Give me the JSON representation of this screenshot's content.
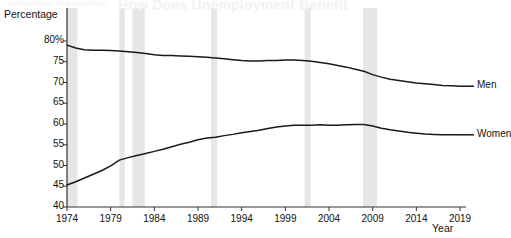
{
  "ghost_text": {
    "heading": "How Does Unemployment Benefit",
    "subheading": "percentage of population"
  },
  "axis": {
    "y_title": "Percentage",
    "x_title": "Year"
  },
  "series_labels": {
    "men": "Men",
    "women": "Women"
  },
  "colors": {
    "line": "#1a1a1a",
    "recession_band": "#e6e6e6",
    "axis": "#333333",
    "background": "#ffffff",
    "text": "#111111"
  },
  "chart_data": {
    "type": "line",
    "title": "",
    "subtitle": "",
    "xlabel": "Year",
    "ylabel": "Percentage",
    "xlim": [
      1974,
      2019
    ],
    "ylim": [
      40,
      80
    ],
    "grid": false,
    "legend_position": "right-inline",
    "y_ticks": [
      "40",
      "45",
      "50",
      "55",
      "60",
      "65",
      "70",
      "75",
      "80%"
    ],
    "y_tick_values": [
      40,
      45,
      50,
      55,
      60,
      65,
      70,
      75,
      80
    ],
    "x_ticks": [
      "1974",
      "1979",
      "1984",
      "1989",
      "1994",
      "1999",
      "2004",
      "2009",
      "2014",
      "2019"
    ],
    "x_tick_values": [
      1974,
      1979,
      1984,
      1989,
      1994,
      1999,
      2004,
      2009,
      2014,
      2019
    ],
    "x": [
      1974,
      1975,
      1976,
      1977,
      1978,
      1979,
      1980,
      1981,
      1982,
      1983,
      1984,
      1985,
      1986,
      1987,
      1988,
      1989,
      1990,
      1991,
      1992,
      1993,
      1994,
      1995,
      1996,
      1997,
      1998,
      1999,
      2000,
      2001,
      2002,
      2003,
      2004,
      2005,
      2006,
      2007,
      2008,
      2009,
      2010,
      2011,
      2012,
      2013,
      2014,
      2015,
      2016,
      2017,
      2018,
      2019
    ],
    "series": [
      {
        "name": "Men",
        "values": [
          79.0,
          78.3,
          77.9,
          77.8,
          77.8,
          77.7,
          77.6,
          77.4,
          77.2,
          77.0,
          76.7,
          76.5,
          76.5,
          76.4,
          76.3,
          76.2,
          76.1,
          75.9,
          75.7,
          75.5,
          75.3,
          75.2,
          75.2,
          75.3,
          75.3,
          75.4,
          75.4,
          75.3,
          75.1,
          74.8,
          74.5,
          74.1,
          73.7,
          73.2,
          72.7,
          71.9,
          71.3,
          70.8,
          70.5,
          70.2,
          69.9,
          69.7,
          69.5,
          69.3,
          69.2,
          69.1
        ]
      },
      {
        "name": "Women",
        "values": [
          45.3,
          46.1,
          47.0,
          47.9,
          48.8,
          49.9,
          51.3,
          51.9,
          52.4,
          52.9,
          53.4,
          53.9,
          54.5,
          55.1,
          55.6,
          56.2,
          56.6,
          56.8,
          57.2,
          57.5,
          57.9,
          58.2,
          58.5,
          58.9,
          59.3,
          59.5,
          59.7,
          59.7,
          59.7,
          59.8,
          59.7,
          59.7,
          59.8,
          59.9,
          59.9,
          59.5,
          59.0,
          58.6,
          58.3,
          58.0,
          57.8,
          57.6,
          57.5,
          57.4,
          57.4,
          57.4
        ]
      }
    ],
    "recession_bands": [
      {
        "start": 1974.0,
        "end": 1975.2
      },
      {
        "start": 1980.0,
        "end": 1980.6
      },
      {
        "start": 1981.5,
        "end": 1982.9
      },
      {
        "start": 1990.5,
        "end": 1991.2
      },
      {
        "start": 2001.2,
        "end": 2001.9
      },
      {
        "start": 2007.9,
        "end": 2009.5
      }
    ]
  }
}
